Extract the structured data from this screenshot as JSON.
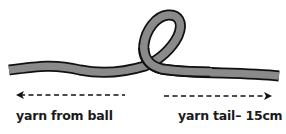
{
  "diagram": {
    "labels": {
      "left": "yarn from ball",
      "right": "yarn tail– 15cm"
    },
    "colors": {
      "yarn_fill": "#8a8a8a",
      "yarn_outline": "#111111",
      "arrow": "#111111",
      "text": "#1a1a1a",
      "background": "#ffffff"
    }
  }
}
